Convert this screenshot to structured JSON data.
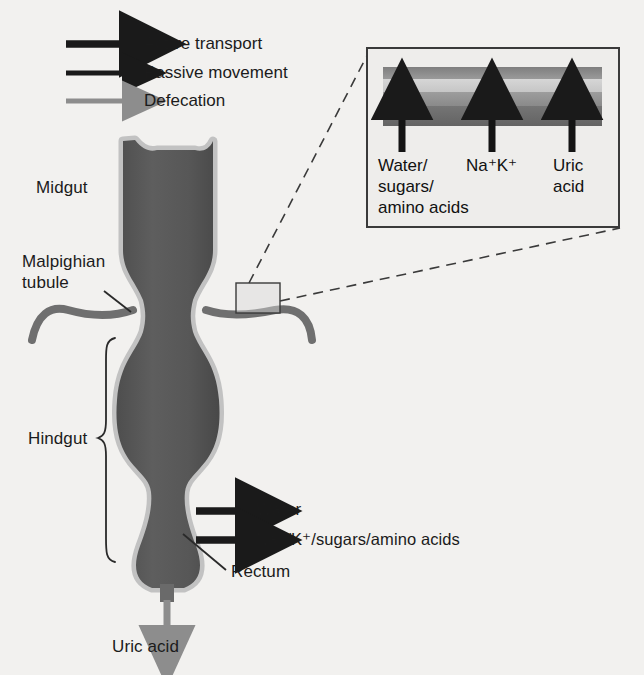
{
  "figure": {
    "background_color": "#f2f1ef",
    "gut_fill_color": "#5a5a5a",
    "gut_rim_color": "#b9b9b9",
    "tubule_color": "#6a6a6a",
    "arrow_black": "#1a1a1a",
    "arrow_gray": "#8d8d8d"
  },
  "legend": {
    "items": [
      {
        "label": "Active transport",
        "arrow": "thick-black-arrow",
        "color": "#1a1a1a",
        "thickness": 7
      },
      {
        "label": "Passive movement",
        "arrow": "thin-black-arrow",
        "color": "#1a1a1a",
        "thickness": 5
      },
      {
        "label": "Defecation",
        "arrow": "gray-arrow",
        "color": "#8d8d8d",
        "thickness": 5
      }
    ]
  },
  "anatomy_labels": {
    "midgut": "Midgut",
    "malpighian_tubule_line1": "Malpighian",
    "malpighian_tubule_line2": "tubule",
    "hindgut": "Hindgut",
    "rectum": "Rectum"
  },
  "rectum_transport": {
    "water": "Water",
    "ions_sugars": "Na⁺/K⁺/sugars/amino acids"
  },
  "defecation": {
    "label": "Uric acid"
  },
  "inset": {
    "border_color": "#3a3a3a",
    "bands": [
      {
        "name": "outer-wall-top",
        "color": "#8f8f8f"
      },
      {
        "name": "lumen",
        "color": "#d0d0d0"
      },
      {
        "name": "inner-wall",
        "color": "#989898"
      },
      {
        "name": "outer-wall-bottom",
        "color": "#6f6f6f"
      }
    ],
    "arrows": [
      {
        "name": "water-sugars-amino-acids-arrow",
        "label_line1": "Water/",
        "label_line2": "sugars/",
        "label_line3": "amino acids"
      },
      {
        "name": "sodium-potassium-arrow",
        "label_line1": "Na⁺K⁺"
      },
      {
        "name": "uric-acid-arrow",
        "label_line1": "Uric",
        "label_line2": "acid"
      }
    ]
  }
}
